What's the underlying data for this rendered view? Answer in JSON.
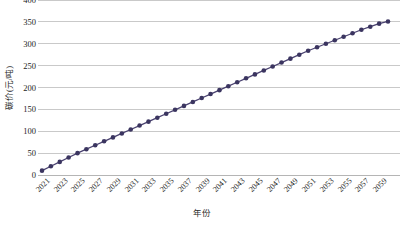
{
  "chart_data": {
    "type": "line",
    "title": "",
    "subtitle": "",
    "xlabel": "年份",
    "ylabel": "碳价(元/吨)",
    "ylim": [
      0,
      400
    ],
    "ytick_values": [
      0,
      50,
      100,
      150,
      200,
      250,
      300,
      350,
      400
    ],
    "ytick_labels": [
      "0",
      "50",
      "100",
      "150",
      "200",
      "250",
      "300",
      "350",
      "400"
    ],
    "grid": true,
    "legend": "none",
    "marker": "circle",
    "series_color": "#3b3560",
    "line_color": "#4a4270",
    "x": [
      2021,
      2022,
      2023,
      2024,
      2025,
      2026,
      2027,
      2028,
      2029,
      2030,
      2031,
      2032,
      2033,
      2034,
      2035,
      2036,
      2037,
      2038,
      2039,
      2040,
      2041,
      2042,
      2043,
      2044,
      2045,
      2046,
      2047,
      2048,
      2049,
      2050,
      2051,
      2052,
      2053,
      2054,
      2055,
      2056,
      2057,
      2058,
      2059,
      2060
    ],
    "xtick_labels": [
      "2021",
      "2023",
      "2025",
      "2027",
      "2029",
      "2031",
      "2033",
      "2035",
      "2037",
      "2039",
      "2041",
      "2043",
      "2045",
      "2047",
      "2049",
      "2051",
      "2053",
      "2055",
      "2057",
      "2059"
    ],
    "series": [
      {
        "name": "碳价",
        "values": [
          10,
          20,
          30,
          40,
          50,
          59,
          68,
          77,
          86,
          95,
          104,
          113,
          122,
          131,
          140,
          149,
          158,
          167,
          176,
          185,
          194,
          203,
          212,
          221,
          230,
          239,
          248,
          257,
          266,
          275,
          284,
          292,
          300,
          308,
          316,
          324,
          332,
          339,
          346,
          351
        ]
      }
    ]
  }
}
